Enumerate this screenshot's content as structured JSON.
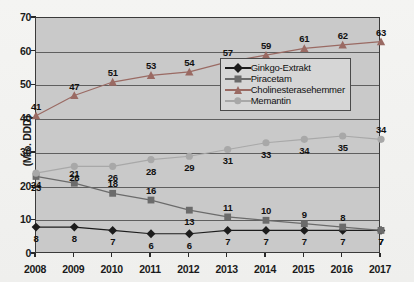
{
  "chart_data": {
    "type": "line",
    "title": "",
    "xlabel": "",
    "ylabel": "(Mio. DDD)",
    "x": [
      2008,
      2009,
      2010,
      2011,
      2012,
      2013,
      2014,
      2015,
      2016,
      2017
    ],
    "categories": [
      "2008",
      "2009",
      "2010",
      "2011",
      "2012",
      "2013",
      "2014",
      "2015",
      "2016",
      "2017"
    ],
    "ylim": [
      0,
      70
    ],
    "yticks": [
      0,
      10,
      20,
      30,
      40,
      50,
      60,
      70
    ],
    "ytick_labels": [
      "0",
      "10",
      "20",
      "30",
      "40",
      "50",
      "60",
      "70"
    ],
    "grid": true,
    "legend_position": "center-right-inside",
    "series": [
      {
        "name": "Ginkgo-Extrakt",
        "marker": "diamond",
        "color": "#1c1c1c",
        "values": [
          8,
          8,
          7,
          6,
          6,
          7,
          7,
          7,
          7,
          7
        ],
        "labels": [
          "8",
          "8",
          "7",
          "6",
          "6",
          "7",
          "7",
          "7",
          "7",
          "7"
        ]
      },
      {
        "name": "Piracetam",
        "marker": "square",
        "color": "#6b6b6b",
        "values": [
          23,
          21,
          18,
          16,
          13,
          11,
          10,
          9,
          8,
          7
        ],
        "labels": [
          "23",
          "21",
          "18",
          "16",
          "13",
          "11",
          "10",
          "9",
          "8",
          "7"
        ]
      },
      {
        "name": "Cholinesterasehemmer",
        "marker": "triangle",
        "color": "#9a6a63",
        "values": [
          41,
          47,
          51,
          53,
          54,
          57,
          59,
          61,
          62,
          63
        ],
        "labels": [
          "41",
          "47",
          "51",
          "53",
          "54",
          "57",
          "59",
          "61",
          "62",
          "63"
        ]
      },
      {
        "name": "Memantin",
        "marker": "circle",
        "color": "#a8a8a8",
        "values": [
          24,
          26,
          26,
          28,
          29,
          31,
          33,
          34,
          35,
          34
        ],
        "labels": [
          "24",
          "26",
          "26",
          "28",
          "29",
          "31",
          "33",
          "34",
          "35",
          "34"
        ]
      }
    ]
  },
  "legend": {
    "entries": [
      {
        "label": "Ginkgo-Extrakt"
      },
      {
        "label": "Piracetam"
      },
      {
        "label": "Cholinesterasehemmer"
      },
      {
        "label": "Memantin"
      }
    ]
  },
  "colors": {
    "plot_background": "#c9c9c9",
    "page_background": "#f1f1ef",
    "axis": "#3a3a3a",
    "gridline": "#5f5f5f",
    "ginkgo": "#1c1c1c",
    "piracetam": "#6b6b6b",
    "cholinesterasehemmer": "#9a6a63",
    "memantin": "#a8a8a8"
  }
}
